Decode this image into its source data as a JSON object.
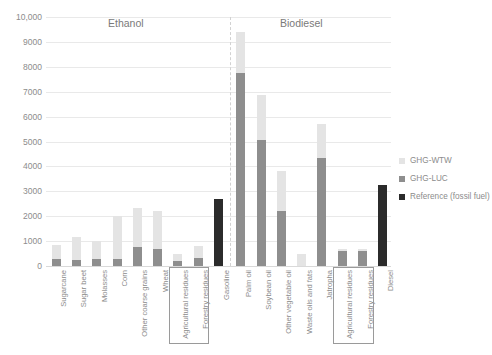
{
  "chart_data": {
    "type": "bar",
    "title": "",
    "xlabel": "",
    "ylabel": "",
    "ylim": [
      0,
      10000
    ],
    "ytick_labels": [
      "10,000",
      "9000",
      "8000",
      "7000",
      "6000",
      "5000",
      "4000",
      "3000",
      "2000",
      "1000",
      "0"
    ],
    "ytick_values": [
      10000,
      9000,
      8000,
      7000,
      6000,
      5000,
      4000,
      3000,
      2000,
      1000,
      0
    ],
    "grid": true,
    "stacked": true,
    "legend_position": "right",
    "legend": [
      "GHG-WTW",
      "GHG-LUC",
      "Reference (fossil fuel)"
    ],
    "series": [
      {
        "name": "GHG-LUC",
        "color": "#8e8e8e"
      },
      {
        "name": "GHG-WTW",
        "color": "#e4e4e4"
      },
      {
        "name": "Reference (fossil fuel)",
        "color": "#2b2b2b"
      }
    ],
    "sections": [
      {
        "name": "Ethanol",
        "categories": [
          "Sugarcane",
          "Sugar beet",
          "Molasses",
          "Corn",
          "Other coarse grains",
          "Wheat",
          "Agricultural residues",
          "Forestry residues",
          "Gasoline"
        ]
      },
      {
        "name": "Biodiesel",
        "categories": [
          "Palm oil",
          "Soybean oil",
          "Other vegetable oil",
          "Waste oils and fats",
          "Jatropha",
          "Agricultural residues",
          "Forestry residues",
          "Diesel"
        ]
      }
    ],
    "categories": [
      "Sugarcane",
      "Sugar beet",
      "Molasses",
      "Corn",
      "Other coarse grains",
      "Wheat",
      "Agricultural residues",
      "Forestry residues",
      "Gasoline",
      "Palm oil",
      "Soybean oil",
      "Other vegetable oil",
      "Waste oils and fats",
      "Jatropha",
      "Agricultural residues",
      "Forestry residues",
      "Diesel"
    ],
    "bars": [
      {
        "label": "Sugarcane",
        "section": "Ethanol",
        "luc": 300,
        "wtw": 550,
        "total": 850,
        "reference": null
      },
      {
        "label": "Sugar beet",
        "section": "Ethanol",
        "luc": 250,
        "wtw": 900,
        "total": 1150,
        "reference": null
      },
      {
        "label": "Molasses",
        "section": "Ethanol",
        "luc": 280,
        "wtw": 720,
        "total": 1000,
        "reference": null
      },
      {
        "label": "Corn",
        "section": "Ethanol",
        "luc": 300,
        "wtw": 1700,
        "total": 2000,
        "reference": null
      },
      {
        "label": "Other coarse grains",
        "section": "Ethanol",
        "luc": 750,
        "wtw": 1600,
        "total": 2350,
        "reference": null
      },
      {
        "label": "Wheat",
        "section": "Ethanol",
        "luc": 700,
        "wtw": 1500,
        "total": 2200,
        "reference": null
      },
      {
        "label": "Agricultural residues",
        "section": "Ethanol",
        "luc": 200,
        "wtw": 300,
        "total": 500,
        "reference": null
      },
      {
        "label": "Forestry residues",
        "section": "Ethanol",
        "luc": 320,
        "wtw": 480,
        "total": 800,
        "reference": null
      },
      {
        "label": "Gasoline",
        "section": "Ethanol",
        "luc": 0,
        "wtw": 0,
        "total": 2700,
        "reference": 2700
      },
      {
        "label": "Palm oil",
        "section": "Biodiesel",
        "luc": 7750,
        "wtw": 1650,
        "total": 9400,
        "reference": null
      },
      {
        "label": "Soybean oil",
        "section": "Biodiesel",
        "luc": 5050,
        "wtw": 1800,
        "total": 6850,
        "reference": null
      },
      {
        "label": "Other vegetable oil",
        "section": "Biodiesel",
        "luc": 2200,
        "wtw": 1600,
        "total": 3800,
        "reference": null
      },
      {
        "label": "Waste oils and fats",
        "section": "Biodiesel",
        "luc": 0,
        "wtw": 500,
        "total": 500,
        "reference": null
      },
      {
        "label": "Jatropha",
        "section": "Biodiesel",
        "luc": 4350,
        "wtw": 1350,
        "total": 5700,
        "reference": null
      },
      {
        "label": "Agricultural residues",
        "section": "Biodiesel",
        "luc": 600,
        "wtw": 100,
        "total": 700,
        "reference": null
      },
      {
        "label": "Forestry residues",
        "section": "Biodiesel",
        "luc": 600,
        "wtw": 100,
        "total": 700,
        "reference": null
      },
      {
        "label": "Diesel",
        "section": "Biodiesel",
        "luc": 0,
        "wtw": 0,
        "total": 3250,
        "reference": 3250
      }
    ],
    "highlight_boxes": [
      {
        "label": "Ethanol residues group",
        "from_index": 6,
        "to_index": 7
      },
      {
        "label": "Biodiesel residues group",
        "from_index": 14,
        "to_index": 15
      }
    ],
    "colors": {
      "wtw": "#e4e4e4",
      "luc": "#8e8e8e",
      "reference": "#2b2b2b",
      "grid": "#e9e9e9",
      "text": "#8c8c8c"
    }
  }
}
